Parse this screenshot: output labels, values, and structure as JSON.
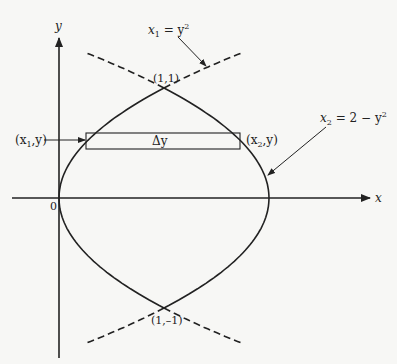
{
  "diagram": {
    "axes": {
      "x_label": "x",
      "y_label": "y",
      "origin_label": "0"
    },
    "curves": [
      {
        "name": "x1",
        "equation_lhs": "x",
        "equation_sub": "1",
        "equation_rhs": " = y",
        "equation_sup": "2"
      },
      {
        "name": "x2",
        "equation_lhs": "x",
        "equation_sub": "2",
        "equation_rhs": " = 2 − y",
        "equation_sup": "2"
      }
    ],
    "points": {
      "top": "(1,1)",
      "bottom": "(1,–1)"
    },
    "strip": {
      "label": "Δy",
      "left_point_open": "(x",
      "left_point_sub": "1",
      "left_point_close": ",y)",
      "right_point_open": "(x",
      "right_point_sub": "2",
      "right_point_close": ",y)"
    },
    "colors": {
      "stroke": "#222222",
      "background": "#f7f7f5"
    }
  }
}
